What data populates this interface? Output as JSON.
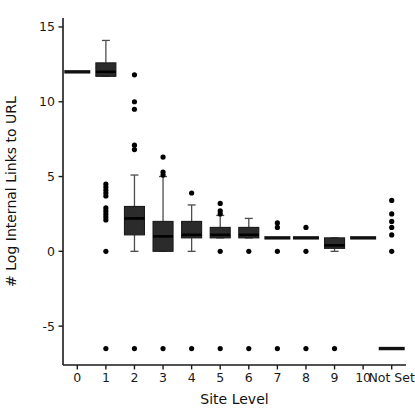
{
  "chart_data": {
    "type": "box",
    "title": "",
    "xlabel": "Site Level",
    "ylabel": "# Log Internal Links to URL",
    "categories": [
      "0",
      "1",
      "2",
      "3",
      "4",
      "5",
      "6",
      "7",
      "8",
      "9",
      "10",
      "Not Set"
    ],
    "yticks": [
      15,
      10,
      5,
      0,
      -5
    ],
    "ylim": [
      -7.6,
      15.6
    ],
    "grid": false,
    "legend": null,
    "accent_color": "#2b2b2b",
    "boxes": [
      {
        "category": "0",
        "degenerate": true,
        "q1": 12.0,
        "median": 12.0,
        "q3": 12.0,
        "whisker_low": 12.0,
        "whisker_high": 12.0,
        "outliers": []
      },
      {
        "category": "1",
        "degenerate": false,
        "q1": 11.7,
        "median": 12.0,
        "q3": 12.6,
        "whisker_low": 11.7,
        "whisker_high": 14.1,
        "outliers": [
          4.5,
          4.3,
          4.1,
          3.9,
          3.7,
          2.9,
          2.7,
          2.5,
          2.3,
          2.1,
          0.0,
          -6.5
        ]
      },
      {
        "category": "2",
        "degenerate": false,
        "q1": 1.1,
        "median": 2.2,
        "q3": 3.0,
        "whisker_low": 0.0,
        "whisker_high": 5.1,
        "outliers": [
          11.8,
          10.0,
          9.5,
          7.1,
          6.8,
          -6.5
        ]
      },
      {
        "category": "3",
        "degenerate": false,
        "q1": 0.0,
        "median": 1.0,
        "q3": 2.0,
        "whisker_low": 0.0,
        "whisker_high": 5.0,
        "outliers": [
          6.3,
          5.3,
          5.1,
          -6.5
        ]
      },
      {
        "category": "4",
        "degenerate": false,
        "q1": 0.9,
        "median": 1.1,
        "q3": 2.0,
        "whisker_low": 0.0,
        "whisker_high": 3.1,
        "outliers": [
          3.9,
          -6.5
        ]
      },
      {
        "category": "5",
        "degenerate": false,
        "q1": 0.9,
        "median": 1.1,
        "q3": 1.6,
        "whisker_low": 0.9,
        "whisker_high": 2.4,
        "outliers": [
          3.2,
          2.7,
          2.5,
          0.0,
          -6.5
        ]
      },
      {
        "category": "6",
        "degenerate": false,
        "q1": 0.9,
        "median": 1.1,
        "q3": 1.6,
        "whisker_low": 0.9,
        "whisker_high": 2.2,
        "outliers": [
          0.0,
          -6.5
        ]
      },
      {
        "category": "7",
        "degenerate": true,
        "q1": 0.9,
        "median": 0.9,
        "q3": 0.9,
        "whisker_low": 0.9,
        "whisker_high": 0.9,
        "outliers": [
          1.9,
          1.6,
          0.0,
          -6.5
        ]
      },
      {
        "category": "8",
        "degenerate": true,
        "q1": 0.9,
        "median": 0.9,
        "q3": 0.9,
        "whisker_low": 0.9,
        "whisker_high": 0.9,
        "outliers": [
          1.6,
          0.0,
          -6.5
        ]
      },
      {
        "category": "9",
        "degenerate": false,
        "q1": 0.2,
        "median": 0.4,
        "q3": 0.9,
        "whisker_low": 0.0,
        "whisker_high": 0.9,
        "outliers": [
          -6.5
        ]
      },
      {
        "category": "10",
        "degenerate": true,
        "q1": 0.9,
        "median": 0.9,
        "q3": 0.9,
        "whisker_low": 0.9,
        "whisker_high": 0.9,
        "outliers": []
      },
      {
        "category": "Not Set",
        "degenerate": true,
        "q1": -6.5,
        "median": -6.5,
        "q3": -6.5,
        "whisker_low": -6.5,
        "whisker_high": -6.5,
        "outliers": [
          3.4,
          2.5,
          2.0,
          1.6,
          1.1,
          0.0
        ]
      }
    ]
  },
  "axes": {
    "x_title": "Site Level",
    "y_title": "# Log Internal Links to URL",
    "y_tick_labels": [
      "15",
      "10",
      "5",
      "0",
      "-5"
    ],
    "x_tick_labels": [
      "0",
      "1",
      "2",
      "3",
      "4",
      "5",
      "6",
      "7",
      "8",
      "9",
      "10",
      "Not Set"
    ]
  }
}
